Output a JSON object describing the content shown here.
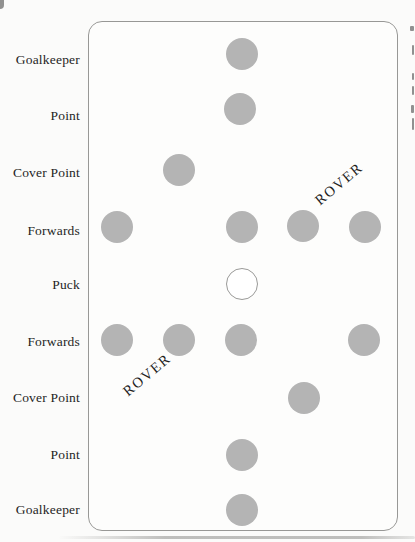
{
  "page": {
    "background": "#fbfbfa",
    "text_color": "#1f1f1e",
    "rink": {
      "left": 88,
      "top": 21,
      "width": 308,
      "height": 508,
      "corner_radius": 14,
      "border_color": "#989896",
      "fill": "#fdfdfc"
    },
    "player_style": {
      "diameter": 32,
      "fill": "#b4b4b4"
    },
    "puck_style": {
      "fill": "#ffffff",
      "border": "#9a9a98"
    },
    "row_labels": [
      {
        "label": "Goalkeeper",
        "y": 60
      },
      {
        "label": "Point",
        "y": 116
      },
      {
        "label": "Cover Point",
        "y": 173
      },
      {
        "label": "Forwards",
        "y": 231
      },
      {
        "label": "Puck",
        "y": 285
      },
      {
        "label": "Forwards",
        "y": 342
      },
      {
        "label": "Cover Point",
        "y": 398
      },
      {
        "label": "Point",
        "y": 455
      },
      {
        "label": "Goalkeeper",
        "y": 510
      }
    ],
    "players": [
      {
        "role": "goalkeeper-top",
        "x": 242,
        "y": 54,
        "is_puck": false
      },
      {
        "role": "point-top",
        "x": 240,
        "y": 109,
        "is_puck": false
      },
      {
        "role": "cover-point-top",
        "x": 179,
        "y": 170,
        "is_puck": false
      },
      {
        "role": "forward-top-left",
        "x": 117,
        "y": 227,
        "is_puck": false
      },
      {
        "role": "forward-top-center",
        "x": 242,
        "y": 227,
        "is_puck": false
      },
      {
        "role": "forward-top-right1",
        "x": 303,
        "y": 226,
        "is_puck": false
      },
      {
        "role": "forward-top-right2",
        "x": 365,
        "y": 227,
        "is_puck": false
      },
      {
        "role": "puck",
        "x": 242,
        "y": 284,
        "is_puck": true
      },
      {
        "role": "forward-bot-left1",
        "x": 117,
        "y": 340,
        "is_puck": false
      },
      {
        "role": "forward-bot-left2",
        "x": 179,
        "y": 340,
        "is_puck": false
      },
      {
        "role": "forward-bot-center",
        "x": 241,
        "y": 340,
        "is_puck": false
      },
      {
        "role": "forward-bot-right",
        "x": 364,
        "y": 340,
        "is_puck": false
      },
      {
        "role": "cover-point-bottom",
        "x": 304,
        "y": 398,
        "is_puck": false
      },
      {
        "role": "point-bottom",
        "x": 242,
        "y": 455,
        "is_puck": false
      },
      {
        "role": "goalkeeper-bottom",
        "x": 242,
        "y": 510,
        "is_puck": false
      }
    ],
    "rover_labels": [
      {
        "label": "ROVER",
        "x": 339,
        "y": 184
      },
      {
        "label": "ROVER",
        "x": 147,
        "y": 375
      }
    ],
    "edge_fragments": [
      {
        "y": 26,
        "height": 5,
        "width": 4
      },
      {
        "y": 45,
        "height": 10,
        "width": 2
      },
      {
        "y": 73,
        "height": 7,
        "width": 2
      },
      {
        "y": 86,
        "height": 9,
        "width": 2
      },
      {
        "y": 105,
        "height": 8,
        "width": 3
      },
      {
        "y": 118,
        "height": 12,
        "width": 2
      }
    ]
  }
}
